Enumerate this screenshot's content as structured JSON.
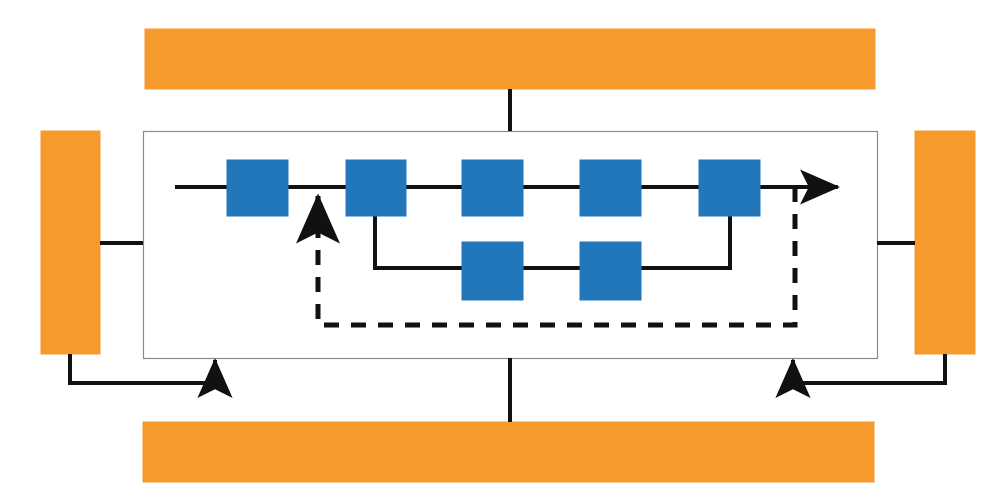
{
  "figure": {
    "type": "block-diagram",
    "title": "",
    "background_color": "#ffffff",
    "width": 1006,
    "height": 501
  },
  "colors": {
    "orange_bar_fill": "#f79a2e",
    "orange_bar_stroke": "#f79a2e",
    "blue_block_fill": "#2277bb",
    "blue_block_stroke": "#2277bb",
    "connector_stroke": "#111111",
    "container_stroke": "#8a8a8a",
    "container_fill": "#ffffff"
  },
  "container": {
    "name": "inner-pipeline-container",
    "label": "",
    "x": 143,
    "y": 131,
    "width": 734,
    "height": 227,
    "stroke_width": 1.2
  },
  "orange_bars": [
    {
      "id": "top-bar",
      "label": "",
      "orientation": "horizontal",
      "x": 145,
      "y": 29,
      "width": 730,
      "height": 60
    },
    {
      "id": "left-bar",
      "label": "",
      "orientation": "vertical",
      "x": 41,
      "y": 131,
      "width": 59,
      "height": 223
    },
    {
      "id": "right-bar",
      "label": "",
      "orientation": "vertical",
      "x": 915,
      "y": 131,
      "width": 60,
      "height": 223
    },
    {
      "id": "bottom-bar",
      "label": "",
      "orientation": "horizontal",
      "x": 143,
      "y": 422,
      "width": 731,
      "height": 60
    }
  ],
  "blue_blocks": [
    {
      "id": "block-top-1",
      "label": "",
      "row": "top",
      "index": 1,
      "x": 227,
      "y": 160,
      "width": 61,
      "height": 56
    },
    {
      "id": "block-top-2",
      "label": "",
      "row": "top",
      "index": 2,
      "x": 346,
      "y": 160,
      "width": 60,
      "height": 56
    },
    {
      "id": "block-top-3",
      "label": "",
      "row": "top",
      "index": 3,
      "x": 462,
      "y": 160,
      "width": 61,
      "height": 56
    },
    {
      "id": "block-top-4",
      "label": "",
      "row": "top",
      "index": 4,
      "x": 580,
      "y": 160,
      "width": 61,
      "height": 56
    },
    {
      "id": "block-top-5",
      "label": "",
      "row": "top",
      "index": 5,
      "x": 699,
      "y": 160,
      "width": 61,
      "height": 56
    },
    {
      "id": "block-bottom-1",
      "label": "",
      "row": "bottom",
      "index": 1,
      "x": 462,
      "y": 242,
      "width": 61,
      "height": 58
    },
    {
      "id": "block-bottom-2",
      "label": "",
      "row": "bottom",
      "index": 2,
      "x": 580,
      "y": 242,
      "width": 61,
      "height": 58
    }
  ],
  "connectors": {
    "solid": [
      {
        "id": "main-flow-entry",
        "label": "",
        "points": "175,187 227,187"
      },
      {
        "id": "main-flow-1-2",
        "label": "",
        "points": "288,187 346,187"
      },
      {
        "id": "main-flow-2-3",
        "label": "",
        "points": "406,187 462,187"
      },
      {
        "id": "main-flow-3-4",
        "label": "",
        "points": "523,187 580,187"
      },
      {
        "id": "main-flow-4-5",
        "label": "",
        "points": "641,187 699,187"
      },
      {
        "id": "main-flow-output-arrow",
        "label": "",
        "points": "760,187 838,187",
        "arrow_end": true
      },
      {
        "id": "branch-down-left",
        "label": "",
        "points": "375,216 375,268 462,268"
      },
      {
        "id": "branch-bottom-1-2",
        "label": "",
        "points": "523,268 580,268"
      },
      {
        "id": "branch-up-right",
        "label": "",
        "points": "641,268 730,268 730,216"
      },
      {
        "id": "left-bar-to-container",
        "label": "",
        "points": "100,243 143,243"
      },
      {
        "id": "right-bar-to-container",
        "label": "",
        "points": "877,243 915,243"
      },
      {
        "id": "top-bar-to-container",
        "label": "",
        "points": "510,89 510,131"
      },
      {
        "id": "container-to-bottom-bar",
        "label": "",
        "points": "510,358 510,422"
      },
      {
        "id": "left-feedback-arrow",
        "label": "",
        "points": "70,354 70,383 215,383 215,360",
        "arrow_end": true
      },
      {
        "id": "right-feedback-arrow",
        "label": "",
        "points": "945,354 945,383 793,383 793,360",
        "arrow_end": true
      }
    ],
    "dashed": [
      {
        "id": "feedback-loop-dashed",
        "label": "",
        "points": "795,187 795,325 318,325 318,196",
        "arrow_end": true,
        "dash_pattern": "15 12"
      }
    ]
  },
  "arrowheads": {
    "style": "filled-triangle",
    "width": 13,
    "length": 16
  }
}
